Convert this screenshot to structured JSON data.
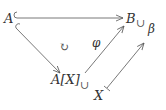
{
  "diagram": {
    "type": "commutative-diagram",
    "nodes": {
      "A": "A",
      "B": "B",
      "AX": "A[X]",
      "X": "X",
      "beta": "β"
    },
    "labels": {
      "phi": "φ",
      "commutes": "↻"
    },
    "hooks": {
      "B_sub": "∪",
      "AX_sub": "∪"
    },
    "edges": [
      {
        "from": "A",
        "to": "B",
        "style": "hook-arrow"
      },
      {
        "from": "A",
        "to": "A[X]",
        "style": "hook-arrow"
      },
      {
        "from": "A[X]",
        "to": "B",
        "style": "arrow",
        "label": "φ"
      },
      {
        "from": "X",
        "to": "β",
        "style": "maps-to"
      }
    ],
    "colors": {
      "stroke": "#555555",
      "text": "#333333"
    }
  }
}
